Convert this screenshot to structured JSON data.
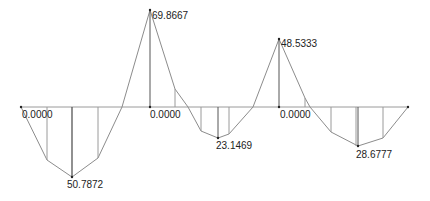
{
  "diagram": {
    "type": "bending-moment-diagram",
    "baseline": {
      "x1": 21,
      "x2": 408,
      "y": 107
    },
    "colors": {
      "baseline": "#9a9a9a",
      "curve": "#8c8c8c",
      "ordinate": "#9a9a9a",
      "ordinate_peak": "#555555",
      "marker": "#222222",
      "label": "#222222"
    },
    "labels": [
      {
        "id": "support-1",
        "text": "0.0000",
        "x": 22,
        "y": 118
      },
      {
        "id": "span-1-max",
        "text": "50.7872",
        "x": 67,
        "y": 188
      },
      {
        "id": "support-2-peak",
        "text": "69.8667",
        "x": 152,
        "y": 19
      },
      {
        "id": "support-2",
        "text": "0.0000",
        "x": 150,
        "y": 118
      },
      {
        "id": "span-2-max",
        "text": "23.1469",
        "x": 216,
        "y": 149
      },
      {
        "id": "support-3-peak",
        "text": "48.5333",
        "x": 281,
        "y": 47
      },
      {
        "id": "support-3",
        "text": "0.0000",
        "x": 280,
        "y": 118
      },
      {
        "id": "span-3-max",
        "text": "28.6777",
        "x": 356,
        "y": 158
      }
    ],
    "values": {
      "span_1_max": "50.7872",
      "support_2": "69.8667",
      "span_2_max": "23.1469",
      "support_3": "48.5333",
      "span_3_max": "28.6777",
      "support_zero": "0.0000"
    }
  }
}
